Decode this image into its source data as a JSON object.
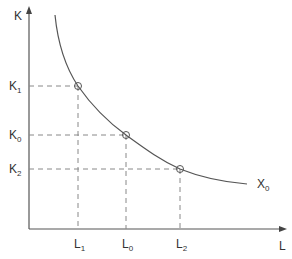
{
  "diagram": {
    "axes": {
      "y_label": "K",
      "x_label": "L"
    },
    "curve_label": {
      "base": "X",
      "sub": "0"
    },
    "points": [
      {
        "k": {
          "base": "K",
          "sub": "1"
        },
        "l": {
          "base": "L",
          "sub": "1"
        },
        "x": 78,
        "y": 86
      },
      {
        "k": {
          "base": "K",
          "sub": "0"
        },
        "l": {
          "base": "L",
          "sub": "0"
        },
        "x": 126,
        "y": 135
      },
      {
        "k": {
          "base": "K",
          "sub": "2"
        },
        "l": {
          "base": "L",
          "sub": "2"
        },
        "x": 180,
        "y": 169
      }
    ],
    "colors": {
      "line": "#555555",
      "dash": "#888888",
      "text": "#333333"
    }
  }
}
